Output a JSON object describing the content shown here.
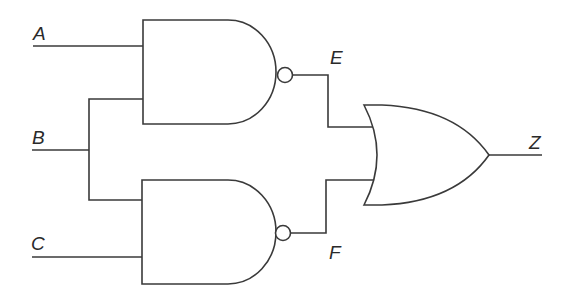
{
  "diagram": {
    "type": "logic-circuit",
    "inputs": [
      {
        "id": "A",
        "label": "A"
      },
      {
        "id": "B",
        "label": "B"
      },
      {
        "id": "C",
        "label": "C"
      }
    ],
    "gates": [
      {
        "id": "nand1",
        "type": "NAND",
        "inputs": [
          "A",
          "B"
        ],
        "output": "E"
      },
      {
        "id": "nand2",
        "type": "NAND",
        "inputs": [
          "B",
          "C"
        ],
        "output": "F"
      },
      {
        "id": "or1",
        "type": "OR",
        "inputs": [
          "E",
          "F"
        ],
        "output": "Z"
      }
    ],
    "intermediate": [
      {
        "id": "E",
        "label": "E"
      },
      {
        "id": "F",
        "label": "F"
      }
    ],
    "output": {
      "id": "Z",
      "label": "Z"
    },
    "colors": {
      "stroke": "#3a3a3a",
      "background": "#ffffff"
    }
  },
  "labels": {
    "A": "A",
    "B": "B",
    "C": "C",
    "E": "E",
    "F": "F",
    "Z": "Z"
  }
}
